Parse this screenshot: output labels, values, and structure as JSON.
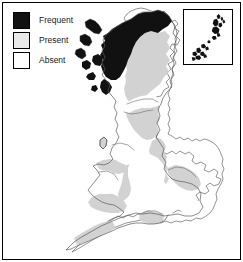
{
  "figure": {
    "width": 243,
    "height": 262,
    "background_color": "#ffffff",
    "frame_color": "#000000"
  },
  "legend": {
    "name": "map-legend",
    "items": [
      {
        "label": "Frequent",
        "swatch": "black",
        "color": "#111111"
      },
      {
        "label": "Present",
        "swatch": "light-gray",
        "color": "#e9e9e9"
      },
      {
        "label": "Absent",
        "swatch": "white",
        "color": "#ffffff"
      }
    ]
  },
  "inset": {
    "name": "shetland-orkney-inset",
    "description": "Inset box showing northern island groups",
    "border_color": "#000000",
    "fill_class": "Frequent"
  },
  "map": {
    "name": "great-britain-distribution-map",
    "outline_color": "#555555",
    "colors": {
      "frequent": "#111111",
      "present": "#d2d2d2",
      "absent": "#ffffff"
    },
    "regions": [
      {
        "name": "northwest-scotland-highlands",
        "class": "Frequent"
      },
      {
        "name": "outer-hebrides",
        "class": "Frequent"
      },
      {
        "name": "inner-hebrides",
        "class": "Frequent"
      },
      {
        "name": "shetland-islands",
        "class": "Frequent"
      },
      {
        "name": "orkney-islands",
        "class": "Frequent"
      },
      {
        "name": "eastern-scotland",
        "class": "Present"
      },
      {
        "name": "central-belt-moray-firth",
        "class": "Absent"
      },
      {
        "name": "southern-uplands",
        "class": "Present"
      },
      {
        "name": "northeast-england",
        "class": "Present"
      },
      {
        "name": "northwest-england",
        "class": "Absent"
      },
      {
        "name": "isle-of-man",
        "class": "Present"
      },
      {
        "name": "north-wales-coast",
        "class": "Present"
      },
      {
        "name": "central-wales",
        "class": "Absent"
      },
      {
        "name": "welsh-borders",
        "class": "Present"
      },
      {
        "name": "east-anglia",
        "class": "Present"
      },
      {
        "name": "midlands",
        "class": "Absent"
      },
      {
        "name": "southwest-england",
        "class": "Present"
      },
      {
        "name": "south-coast-england",
        "class": "Present"
      },
      {
        "name": "southeast-england",
        "class": "Absent"
      }
    ]
  }
}
